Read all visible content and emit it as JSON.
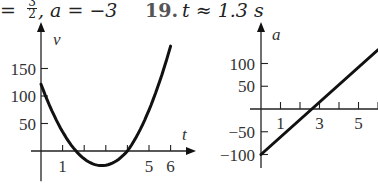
{
  "header": {
    "left_prefix": "=",
    "fraction_num": "3",
    "fraction_den": "2",
    "a_text": ", a = −3",
    "problem_number": "19.",
    "answer": "t ≈ 1.3 s"
  },
  "chart_data": [
    {
      "type": "line",
      "title": "",
      "xlabel": "t",
      "ylabel": "v",
      "xticks": [
        1,
        2,
        3,
        4,
        5,
        6
      ],
      "xtick_labels": [
        "1",
        "5",
        "6"
      ],
      "yticks": [
        50,
        100,
        150
      ],
      "ytick_labels": [
        "50",
        "100",
        "150"
      ],
      "x": [
        0,
        0.5,
        1,
        1.5,
        2,
        2.5,
        2.8,
        3,
        3.5,
        4,
        4.5,
        5,
        5.5,
        6
      ],
      "values": [
        120,
        86,
        57,
        9,
        -10,
        -34,
        -36,
        -22,
        -5,
        0,
        24,
        56,
        105,
        173
      ],
      "description": "Parabolic velocity curve, v(0)≈120, minimum ≈−36 near t≈2.8, zero crossings near t≈1.6 and t≈4, v(6)≈173",
      "xlim": [
        0,
        6.5
      ],
      "ylim": [
        -50,
        190
      ],
      "grid": false
    },
    {
      "type": "line",
      "title": "",
      "xlabel": "",
      "ylabel": "a",
      "xticks": [
        1,
        2,
        3,
        4,
        5,
        6
      ],
      "xtick_labels": [
        "1",
        "3",
        "5"
      ],
      "yticks": [
        -100,
        -50,
        50,
        100
      ],
      "ytick_labels": [
        "−100",
        "−50",
        "50",
        "100"
      ],
      "x": [
        0,
        1,
        2,
        3,
        4,
        5,
        6
      ],
      "values": [
        -100,
        -62,
        -24,
        14,
        52,
        90,
        130
      ],
      "description": "Linear acceleration, a(0)=−100, crosses zero near t≈2.6",
      "xlim": [
        0,
        6
      ],
      "ylim": [
        -110,
        140
      ],
      "grid": false
    }
  ]
}
